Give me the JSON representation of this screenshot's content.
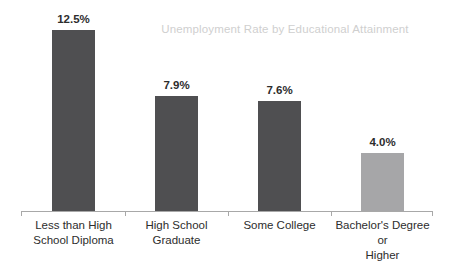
{
  "chart_data": {
    "type": "bar",
    "title": "Unemployment Rate by Educational Attainment",
    "xlabel": "",
    "ylabel": "",
    "ylim": [
      0,
      12.5
    ],
    "grid": false,
    "legend": "none",
    "axis_visible": {
      "x": true,
      "y": false
    },
    "categories": [
      "Less than High School Diploma",
      "High School Graduate",
      "Some College",
      "Bachelor's Degree or Higher"
    ],
    "category_lines": [
      [
        "Less than High",
        "School Diploma"
      ],
      [
        "High School",
        "Graduate"
      ],
      [
        "Some College"
      ],
      [
        "Bachelor's Degree or",
        "Higher"
      ]
    ],
    "values": [
      12.5,
      7.9,
      7.6,
      4.0
    ],
    "value_labels": [
      "12.5%",
      "7.9%",
      "7.6%",
      "4.0%"
    ],
    "bar_colors": [
      "#4f4f51",
      "#4f4f51",
      "#4f4f51",
      "#a6a6a8"
    ],
    "colors": {
      "bar_dark": "#4f4f51",
      "bar_light": "#a6a6a8",
      "title_text": "#cfcfcf",
      "label_text": "#2d2d2d",
      "axis_line": "#a8a8a8",
      "background": "#ffffff"
    }
  }
}
